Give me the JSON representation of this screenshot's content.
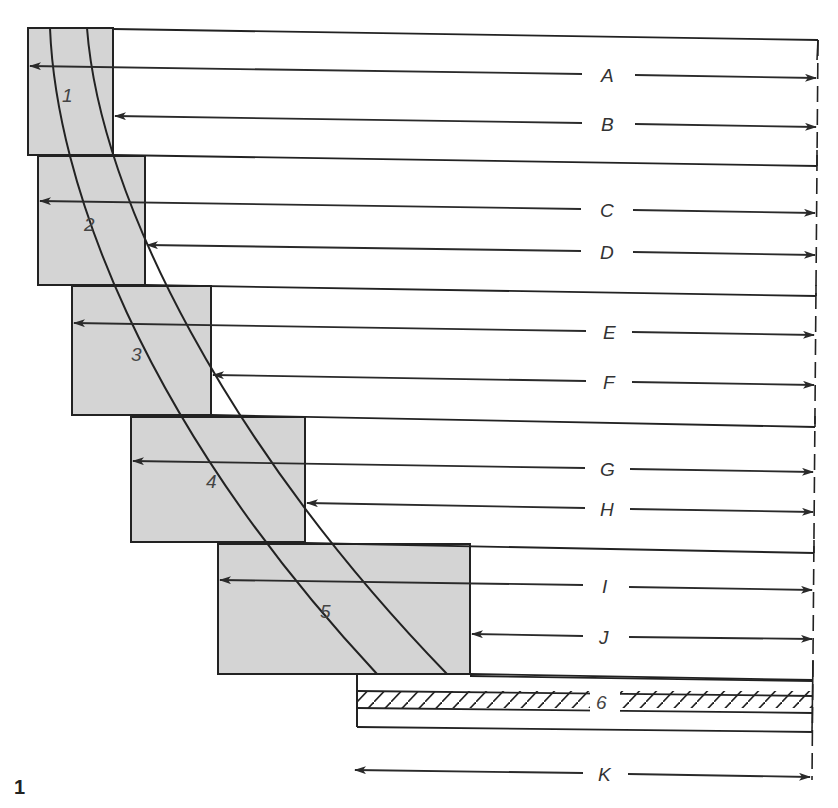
{
  "figure": {
    "number": "1",
    "colors": {
      "block_fill": "#d4d4d4",
      "line": "#222222",
      "background": "#ffffff"
    }
  },
  "blocks": [
    {
      "id": "1",
      "label": "1"
    },
    {
      "id": "2",
      "label": "2"
    },
    {
      "id": "3",
      "label": "3"
    },
    {
      "id": "4",
      "label": "4"
    },
    {
      "id": "5",
      "label": "5"
    }
  ],
  "plate": {
    "label": "6"
  },
  "dimensions": [
    {
      "label": "A"
    },
    {
      "label": "B"
    },
    {
      "label": "C"
    },
    {
      "label": "D"
    },
    {
      "label": "E"
    },
    {
      "label": "F"
    },
    {
      "label": "G"
    },
    {
      "label": "H"
    },
    {
      "label": "I"
    },
    {
      "label": "J"
    },
    {
      "label": "K"
    }
  ]
}
